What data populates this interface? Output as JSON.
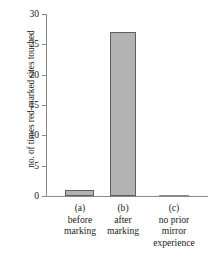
{
  "chart_data": {
    "type": "bar",
    "title": "",
    "subtitle": "",
    "xlabel": "",
    "ylabel": "no. of times red-marked sites touched",
    "categories": [
      "(a)",
      "(b)",
      "(c)"
    ],
    "category_descriptions": [
      [
        "before",
        "marking"
      ],
      [
        "after",
        "marking"
      ],
      [
        "no prior",
        "mirror",
        "experience"
      ]
    ],
    "values": [
      1,
      27,
      0
    ],
    "ylim": [
      0,
      30
    ],
    "yticks": [
      0,
      5,
      10,
      15,
      20,
      25,
      30
    ],
    "ytick_labels": [
      "0",
      "5",
      "10",
      "15",
      "20",
      "25",
      "30"
    ],
    "grid": false,
    "legend": false,
    "legend_position": "none",
    "bar_fill_color": "#b3b3b3",
    "bar_edge_color": "#5f5f5f",
    "axis_color": "#8a8a8a",
    "background_color": "#ffffff"
  },
  "axis": {
    "y_title": "no. of times red-marked sites touched"
  },
  "series": {
    "bars": [
      {
        "tag": "(a)",
        "value": 1,
        "desc_line1": "before",
        "desc_line2": "marking",
        "desc_line3": ""
      },
      {
        "tag": "(b)",
        "value": 27,
        "desc_line1": "after",
        "desc_line2": "marking",
        "desc_line3": ""
      },
      {
        "tag": "(c)",
        "value": 0,
        "desc_line1": "no prior",
        "desc_line2": "mirror",
        "desc_line3": "experience"
      }
    ]
  },
  "ticks": {
    "t0": "0",
    "t1": "5",
    "t2": "10",
    "t3": "15",
    "t4": "20",
    "t5": "25",
    "t6": "30"
  }
}
